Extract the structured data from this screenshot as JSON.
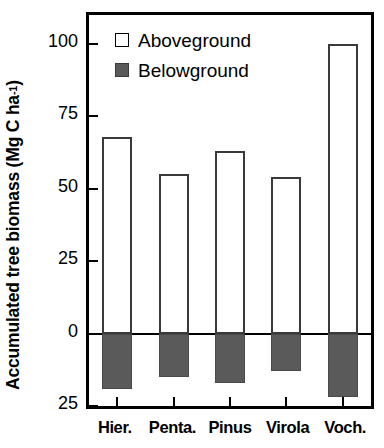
{
  "chart_data": {
    "type": "bar",
    "title": "",
    "subtitle": "",
    "xlabel": "",
    "ylabel": "Accumulated tree biomass (Mg C ha",
    "ylabel_exponent": "-1",
    "ylabel_suffix": ")",
    "categories": [
      "Hier.",
      "Penta.",
      "Pinus",
      "Virola",
      "Voch."
    ],
    "series": [
      {
        "name": "Aboveground",
        "values": [
          68,
          55,
          63,
          54,
          100
        ],
        "fill": "#ffffff",
        "edge": "#3a3a3a"
      },
      {
        "name": "Belowground",
        "values": [
          -19,
          -15,
          -17,
          -13,
          -22
        ],
        "fill": "#5a5a5a",
        "edge": "#4a4a4a"
      }
    ],
    "ylim": [
      -25,
      110
    ],
    "yticks": [
      100,
      75,
      50,
      25,
      0,
      -25
    ],
    "ytick_labels": [
      "100",
      "75",
      "50",
      "25",
      "0",
      "25"
    ],
    "grid": false,
    "legend_position": "upper left",
    "zero_baseline": true,
    "stacked_from_zero": true
  },
  "legend": {
    "entries": [
      {
        "label": "Aboveground",
        "swatch": "open-square-icon"
      },
      {
        "label": "Belowground",
        "swatch": "filled-square-icon"
      }
    ]
  },
  "colors": {
    "axis": "#000000",
    "aboveground_fill": "#ffffff",
    "aboveground_edge": "#3a3a3a",
    "belowground_fill": "#5a5a5a",
    "background": "#ffffff"
  }
}
